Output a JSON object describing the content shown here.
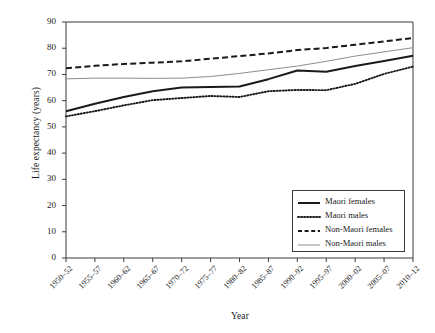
{
  "chart_data": {
    "type": "line",
    "title": "",
    "xlabel": "Year",
    "ylabel": "Life expectancy (years)",
    "ylim": [
      0,
      90
    ],
    "ytick_values": [
      0,
      10,
      20,
      30,
      40,
      50,
      60,
      70,
      80,
      90
    ],
    "grid": false,
    "legend_position": "bottom-right",
    "categories": [
      "1950–52",
      "1955–57",
      "1960–62",
      "1965–67",
      "1970–72",
      "1975–77",
      "1980–82",
      "1985–87",
      "1990–92",
      "1995–97",
      "2000–02",
      "2005–07",
      "2010–12"
    ],
    "series": [
      {
        "name": "Maori females",
        "style": "solid",
        "color": "#1a1a1a",
        "width": 2.0,
        "values": [
          56.0,
          58.8,
          61.4,
          63.6,
          65.0,
          65.2,
          65.4,
          68.2,
          71.5,
          71.0,
          73.2,
          75.1,
          77.1
        ]
      },
      {
        "name": "Maori males",
        "style": "dotted",
        "color": "#1a1a1a",
        "width": 1.9,
        "values": [
          54.0,
          56.0,
          58.2,
          60.2,
          61.0,
          61.8,
          61.4,
          63.6,
          64.1,
          64.0,
          66.4,
          70.2,
          73.0
        ]
      },
      {
        "name": "Non-Maori females",
        "style": "dashed",
        "color": "#1a1a1a",
        "width": 2.0,
        "values": [
          72.4,
          73.3,
          74.0,
          74.5,
          75.0,
          76.0,
          77.0,
          78.0,
          79.3,
          80.1,
          81.3,
          82.6,
          83.9
        ]
      },
      {
        "name": "Non-Maori males",
        "style": "thin-solid",
        "color": "#8e8e8e",
        "width": 1.0,
        "values": [
          68.3,
          68.6,
          68.6,
          68.5,
          68.6,
          69.2,
          70.4,
          71.8,
          73.2,
          75.0,
          77.0,
          78.6,
          80.2
        ]
      }
    ]
  },
  "axes": {
    "y_title": "Life expectancy (years)",
    "x_title": "Year"
  },
  "legend": {
    "entries": [
      {
        "label": "Maori females",
        "key": "solid-line-key"
      },
      {
        "label": "Maori males",
        "key": "dotted-line-key"
      },
      {
        "label": "Non-Maori females",
        "key": "dashed-line-key"
      },
      {
        "label": "Non-Maori males",
        "key": "thin-gray-line-key"
      }
    ]
  },
  "colors": {
    "axis": "#3b3b3b",
    "primary_line": "#1a1a1a",
    "secondary_line": "#8e8e8e",
    "background": "#ffffff"
  }
}
